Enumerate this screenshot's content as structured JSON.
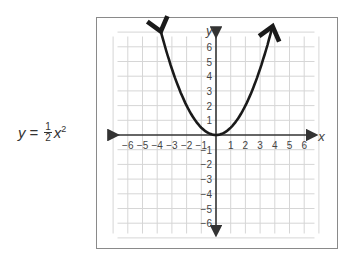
{
  "equation": {
    "lhs": "y",
    "equals": "=",
    "numerator": "1",
    "denominator": "2",
    "variable": "x",
    "exponent": "2"
  },
  "colors": {
    "grid": "#d6d6d6",
    "axis": "#333333",
    "curve": "#1a1a1a",
    "frame": "#8a8a8a",
    "text": "#444444"
  },
  "chart_data": {
    "type": "line",
    "xlabel": "x",
    "ylabel": "y",
    "xlim": [
      -7,
      7
    ],
    "ylim": [
      -7,
      7
    ],
    "grid": true,
    "x_ticks": [
      -6,
      -5,
      -4,
      -3,
      -2,
      -1,
      1,
      2,
      3,
      4,
      5,
      6
    ],
    "y_ticks": [
      -6,
      -5,
      -4,
      -3,
      -2,
      -1,
      1,
      2,
      3,
      4,
      5,
      6
    ],
    "x_tick_labels": [
      "−6",
      "−5",
      "−4",
      "−3",
      "−2",
      "−1",
      "1",
      "2",
      "3",
      "4",
      "5",
      "6"
    ],
    "y_tick_labels": [
      "−6",
      "−5",
      "−4",
      "−3",
      "−2",
      "−1",
      "1",
      "2",
      "3",
      "4",
      "5",
      "6"
    ],
    "series": [
      {
        "name": "y = 1/2 x^2",
        "x": [
          -3.8,
          -3,
          -2,
          -1,
          0,
          1,
          2,
          3,
          3.8
        ],
        "y": [
          7.22,
          4.5,
          2,
          0.5,
          0,
          0.5,
          2,
          4.5,
          7.22
        ],
        "arrows_at_ends": true
      }
    ]
  }
}
